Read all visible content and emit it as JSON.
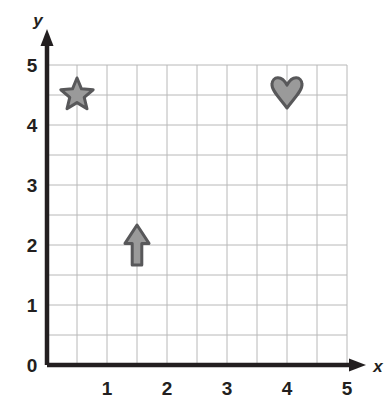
{
  "figure": {
    "kind": "coordinate-plane",
    "background_color": "#ffffff"
  },
  "axes": {
    "x_axis_label": "x",
    "y_axis_label": "y",
    "axis_color": "#231f20",
    "grid_color": "#b8b8b8",
    "x_tick_labels": [
      "1",
      "2",
      "3",
      "4",
      "5"
    ],
    "y_tick_labels": [
      "1",
      "2",
      "3",
      "4",
      "5"
    ],
    "origin_label": "0",
    "x_range": [
      0,
      5
    ],
    "y_range": [
      0,
      5
    ],
    "major_step": 1,
    "minor_step": 0.5,
    "grid": "on"
  },
  "chart_data": {
    "type": "scatter",
    "title": "",
    "xlabel": "x",
    "ylabel": "y",
    "xlim": [
      0,
      5
    ],
    "ylim": [
      0,
      5
    ],
    "xticks": [
      0,
      1,
      2,
      3,
      4,
      5
    ],
    "yticks": [
      0,
      1,
      2,
      3,
      4,
      5
    ],
    "grid": true,
    "minor_gridlines": 0.5,
    "legend": "none",
    "markers": [
      {
        "name": "star",
        "shape": "star",
        "x": 0.5,
        "y": 4.5,
        "fill": "#9a9a9a",
        "stroke": "#58585a"
      },
      {
        "name": "arrow-up",
        "shape": "arrow-up",
        "x": 1.5,
        "y": 2.0,
        "fill": "#9a9a9a",
        "stroke": "#58585a"
      },
      {
        "name": "heart",
        "shape": "heart",
        "x": 4.0,
        "y": 4.5,
        "fill": "#9a9a9a",
        "stroke": "#58585a"
      }
    ]
  }
}
